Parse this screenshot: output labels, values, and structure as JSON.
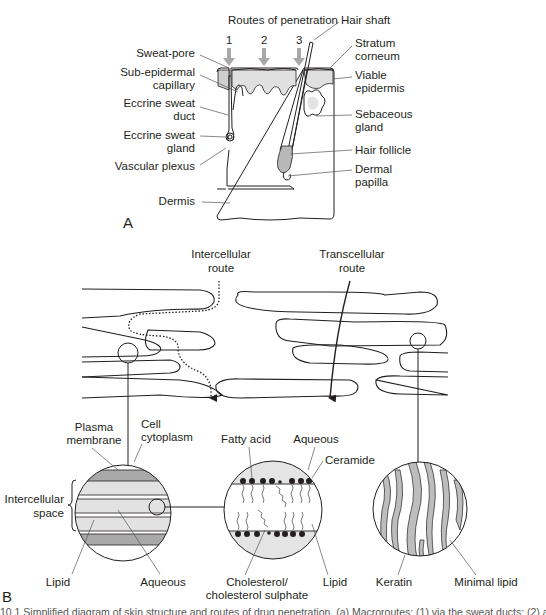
{
  "panel_a": {
    "letter": "A",
    "title": "Routes of penetration",
    "route_numbers": [
      "1",
      "2",
      "3"
    ],
    "labels_left": [
      {
        "line1": "Sweat-pore",
        "line2": ""
      },
      {
        "line1": "Sub-epidermal",
        "line2": "capillary"
      },
      {
        "line1": "Eccrine sweat",
        "line2": "duct"
      },
      {
        "line1": "Eccrine sweat",
        "line2": "gland"
      },
      {
        "line1": "Vascular plexus",
        "line2": ""
      },
      {
        "line1": "Dermis",
        "line2": ""
      }
    ],
    "labels_right": [
      {
        "line1": "Hair shaft",
        "line2": ""
      },
      {
        "line1": "Stratum",
        "line2": "corneum"
      },
      {
        "line1": "Viable",
        "line2": "epidermis"
      },
      {
        "line1": "Sebaceous",
        "line2": "gland"
      },
      {
        "line1": "Hair follicle",
        "line2": ""
      },
      {
        "line1": "Dermal",
        "line2": "papilla"
      }
    ]
  },
  "panel_b": {
    "letter": "B",
    "routes": {
      "intercellular": {
        "line1": "Intercellular",
        "line2": "route"
      },
      "transcellular": {
        "line1": "Transcellular",
        "line2": "route"
      }
    },
    "circle_left": {
      "plasma_membrane": {
        "line1": "Plasma",
        "line2": "membrane"
      },
      "cell_cytoplasm": {
        "line1": "Cell",
        "line2": "cytoplasm"
      },
      "intercellular_space": {
        "line1": "Intercellular",
        "line2": "space"
      },
      "lipid": "Lipid",
      "aqueous": "Aqueous"
    },
    "circle_middle": {
      "fatty_acid": "Fatty acid",
      "aqueous": "Aqueous",
      "ceramide": "Ceramide",
      "cholesterol": {
        "line1": "Cholesterol/",
        "line2": "cholesterol sulphate"
      },
      "lipid": "Lipid"
    },
    "circle_right": {
      "keratin": "Keratin",
      "minimal_lipid": "Minimal lipid"
    }
  },
  "caption": "10.1  Simplified diagram of skin structure and routes of drug penetration. (a) Macroroutes: (1) via the sweat ducts; (2) across the",
  "colors": {
    "line": "#231f20",
    "gray_fill": "#cfcfcf",
    "light_fill": "#e6e6e6",
    "arrow_gray": "#a8a8a8",
    "dark_band": "#a9a9a9"
  }
}
